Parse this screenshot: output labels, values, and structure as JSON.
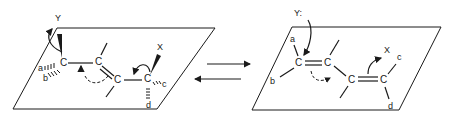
{
  "diagram": {
    "left_structure": {
      "plane": "parallelogram",
      "atoms": [
        "C",
        "C",
        "C",
        "C"
      ],
      "substituent_labels": [
        "Y",
        "a",
        "b",
        "X",
        "c",
        "d"
      ],
      "bonds": [
        "C-C single",
        "C=C double",
        "C-C single"
      ],
      "arrows": [
        "curved arrow Y",
        "curved dashed arrow C1 to C2",
        "curved arrow to X"
      ]
    },
    "equilibrium_arrows": {
      "forward": "right arrow",
      "reverse": "left arrow"
    },
    "right_structure": {
      "plane": "parallelogram",
      "atoms": [
        "C",
        "C",
        "C",
        "C"
      ],
      "substituent_labels": [
        "Y:",
        "a",
        "b",
        "X",
        "c",
        "d"
      ],
      "bonds": [
        "C=C double",
        "C-C single",
        "C=C double"
      ],
      "arrows": [
        "curved arrow from Y: to C",
        "curved dashed arrow to central bond",
        "curved arrow to X"
      ]
    },
    "colors": {
      "ink": "#1a1a1a",
      "background": "#ffffff"
    }
  },
  "labels": {
    "left": {
      "Y": "Y",
      "a": "a",
      "b": "b",
      "X": "X",
      "c": "c",
      "d": "d",
      "C1": "C",
      "C2": "C",
      "C3": "C",
      "C4": "C"
    },
    "right": {
      "Y": "Y:",
      "a": "a",
      "b": "b",
      "X": "X",
      "c": "c",
      "d": "d",
      "C1": "C",
      "C2": "C",
      "C3": "C",
      "C4": "C"
    }
  }
}
